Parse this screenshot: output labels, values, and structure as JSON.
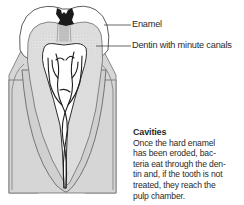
{
  "diagram": {
    "labels": {
      "enamel": "Enamel",
      "dentin": "Dentin with minute canals"
    },
    "caption": {
      "title": "Cavities",
      "body": "Once the hard enamel\nhas been eroded, bac-\nteria eat through the den-\ntin and, if the tooth is not\ntreated, they reach the\npulp chamber."
    },
    "colors": {
      "gum": "#d6d6d6",
      "gum_outline": "#6e6e6e",
      "dentin": "#e3e3e3",
      "enamel": "#ffffff",
      "pulp": "#ffffff",
      "cavity": "#1a1a1a",
      "outline": "#555555"
    }
  }
}
